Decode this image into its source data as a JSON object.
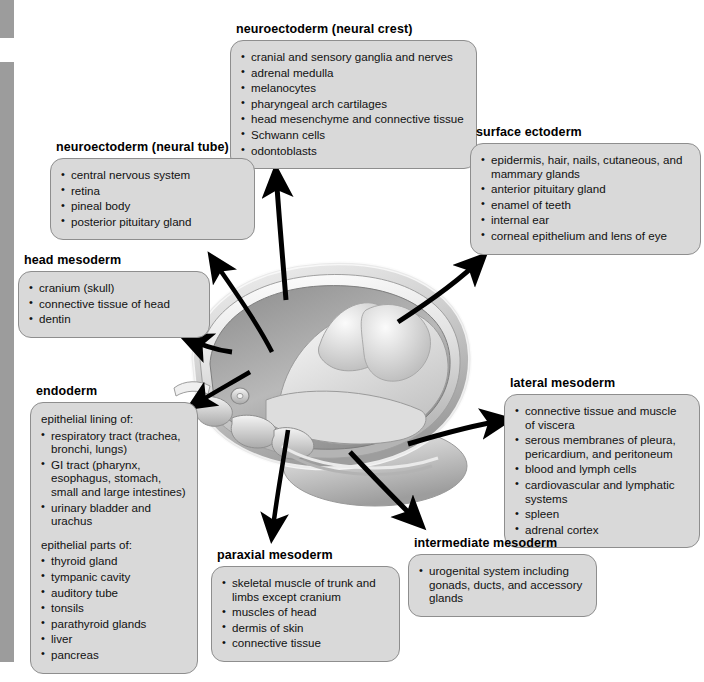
{
  "diagram": {
    "illustration_name": "embryo-cross-section",
    "box_fill": "#d9d9d9",
    "box_border": "#8e8e8e",
    "arrow_color": "#000000"
  },
  "groups": {
    "neural_crest": {
      "title": "neuroectoderm (neural crest)",
      "items": [
        "cranial and sensory ganglia and nerves",
        "adrenal medulla",
        "melanocytes",
        "pharyngeal arch cartilages",
        "head mesenchyme and connective tissue",
        "Schwann cells",
        "odontoblasts"
      ]
    },
    "neural_tube": {
      "title": "neuroectoderm (neural tube)",
      "items": [
        "central nervous system",
        "retina",
        "pineal body",
        "posterior pituitary gland"
      ]
    },
    "head_mesoderm": {
      "title": "head mesoderm",
      "items": [
        "cranium (skull)",
        "connective tissue of head",
        "dentin"
      ]
    },
    "endoderm": {
      "title": "endoderm",
      "lead_1": "epithelial lining of:",
      "items_1": [
        "respiratory tract (trachea, bronchi, lungs)",
        "GI tract (pharynx, esophagus, stomach, small and large intestines)",
        "urinary bladder and urachus"
      ],
      "lead_2": "epithelial parts of:",
      "items_2": [
        "thyroid gland",
        "tympanic cavity",
        "auditory tube",
        "tonsils",
        "parathyroid glands",
        "liver",
        "pancreas"
      ]
    },
    "surface_ectoderm": {
      "title": "surface ectoderm",
      "items": [
        "epidermis, hair, nails, cutaneous, and mammary glands",
        "anterior pituitary gland",
        "enamel of teeth",
        "internal ear",
        "corneal epithelium and lens of eye"
      ]
    },
    "lateral_mesoderm": {
      "title": "lateral mesoderm",
      "items": [
        "connective tissue and muscle of viscera",
        "serous membranes of pleura, pericardium, and peritoneum",
        "blood and lymph cells",
        "cardiovascular and lymphatic systems",
        "spleen",
        "adrenal cortex"
      ]
    },
    "paraxial_mesoderm": {
      "title": "paraxial mesoderm",
      "items": [
        "skeletal muscle of trunk and limbs except cranium",
        "muscles of head",
        "dermis of skin",
        "connective tissue"
      ]
    },
    "intermediate_mesoderm": {
      "title": "intermediate mesoderm",
      "items": [
        "urogenital system including gonads, ducts, and accessory glands"
      ]
    }
  }
}
